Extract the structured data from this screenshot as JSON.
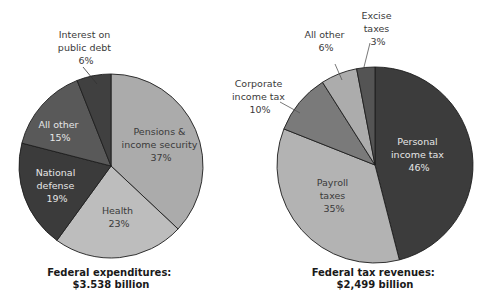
{
  "chart_data": [
    {
      "type": "pie",
      "title": "Federal expenditures:",
      "subtitle": "$3.538 billion",
      "start_angle": "12 o'clock, clockwise",
      "slices": [
        {
          "label": "Pensions & income security",
          "value": 37,
          "color": "#ababab"
        },
        {
          "label": "Health",
          "value": 23,
          "color": "#bdbdbd"
        },
        {
          "label": "National defense",
          "value": 19,
          "color": "#3b3b3b"
        },
        {
          "label": "All other",
          "value": 15,
          "color": "#595959"
        },
        {
          "label": "Interest on public debt",
          "value": 6,
          "color": "#404040"
        }
      ]
    },
    {
      "type": "pie",
      "title": "Federal tax revenues:",
      "subtitle": "$2,499 billion",
      "start_angle": "12 o'clock, clockwise",
      "slices": [
        {
          "label": "Personal income tax",
          "value": 46,
          "color": "#3c3c3c"
        },
        {
          "label": "Payroll taxes",
          "value": 35,
          "color": "#b3b3b3"
        },
        {
          "label": "Corporate income tax",
          "value": 10,
          "color": "#7a7a7a"
        },
        {
          "label": "All other",
          "value": 6,
          "color": "#acacac"
        },
        {
          "label": "Excise taxes",
          "value": 3,
          "color": "#545454"
        }
      ]
    }
  ],
  "left": {
    "labels": {
      "pensions": [
        "Pensions &",
        "income security",
        "37%"
      ],
      "health": [
        "Health",
        "23%"
      ],
      "defense": [
        "National",
        "defense",
        "19%"
      ],
      "other": [
        "All other",
        "15%"
      ],
      "interest": [
        "Interest on",
        "public debt",
        "6%"
      ]
    },
    "caption": [
      "Federal expenditures:",
      "$3.538 billion"
    ]
  },
  "right": {
    "labels": {
      "personal": [
        "Personal",
        "income tax",
        "46%"
      ],
      "payroll": [
        "Payroll",
        "taxes",
        "35%"
      ],
      "corporate": [
        "Corporate",
        "income tax",
        "10%"
      ],
      "other": [
        "All other",
        "6%"
      ],
      "excise": [
        "Excise",
        "taxes",
        "3%"
      ]
    },
    "caption": [
      "Federal tax revenues:",
      "$2,499 billion"
    ]
  }
}
